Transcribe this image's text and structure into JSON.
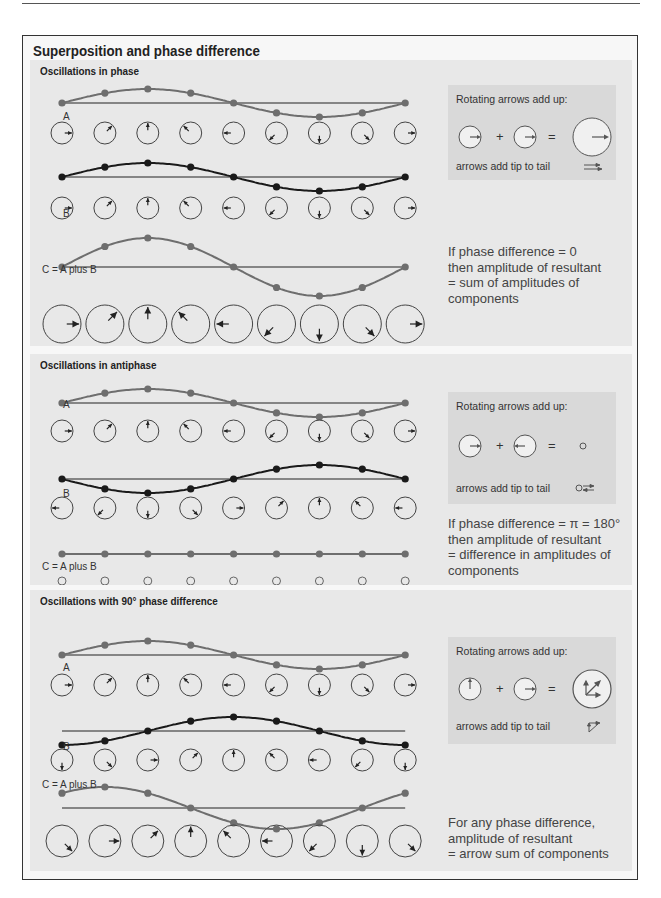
{
  "title": "Superposition and phase difference",
  "colors": {
    "wave_grey": "#6e6e6e",
    "wave_black": "#1a1a1a",
    "panel_bg": "#e8e8e8",
    "infobox_bg": "#d9d9d9",
    "frame_bg": "#f7f7f7"
  },
  "common": {
    "rotating_label": "Rotating arrows add up:",
    "tip_to_tail_label": "arrows add tip to tail",
    "plus": "+",
    "equals": "="
  },
  "panels": [
    {
      "title": "Oscillations in phase",
      "labels": {
        "a": "A",
        "b": "B",
        "c": "C = A plus B"
      },
      "note_lines": [
        "If phase difference = 0",
        "then amplitude of resultant",
        "= sum of amplitudes of",
        "components"
      ],
      "a_arrow_angles_deg": [
        0,
        45,
        90,
        135,
        180,
        225,
        270,
        315,
        360
      ],
      "b_arrow_angles_deg": [
        0,
        45,
        90,
        135,
        180,
        225,
        270,
        315,
        360
      ],
      "c_arrow_angles_deg": [
        0,
        45,
        90,
        135,
        180,
        225,
        270,
        315,
        360
      ],
      "c_relative_amplitude": 2
    },
    {
      "title": "Oscillations in antiphase",
      "labels": {
        "a": "A",
        "b": "B",
        "c": "C = A plus B"
      },
      "note_lines": [
        "If phase difference = π = 180°",
        "then amplitude of resultant",
        "= difference in amplitudes of",
        "components"
      ],
      "a_arrow_angles_deg": [
        0,
        45,
        90,
        135,
        180,
        225,
        270,
        315,
        360
      ],
      "b_arrow_angles_deg": [
        180,
        225,
        270,
        315,
        0,
        45,
        90,
        135,
        180
      ],
      "c_arrow_angles_deg": [],
      "c_relative_amplitude": 0
    },
    {
      "title": "Oscillations with 90° phase difference",
      "labels": {
        "a": "A",
        "b": "B",
        "c": "C = A plus B"
      },
      "note_lines": [
        "For any phase difference,",
        "amplitude of resultant",
        "= arrow sum of components"
      ],
      "a_arrow_angles_deg": [
        0,
        45,
        90,
        135,
        180,
        225,
        270,
        315,
        360
      ],
      "b_arrow_angles_deg": [
        270,
        315,
        0,
        45,
        90,
        135,
        180,
        225,
        270
      ],
      "c_arrow_angles_deg": [
        315,
        0,
        45,
        90,
        135,
        180,
        225,
        270,
        315
      ],
      "c_relative_amplitude": 1.414
    }
  ]
}
